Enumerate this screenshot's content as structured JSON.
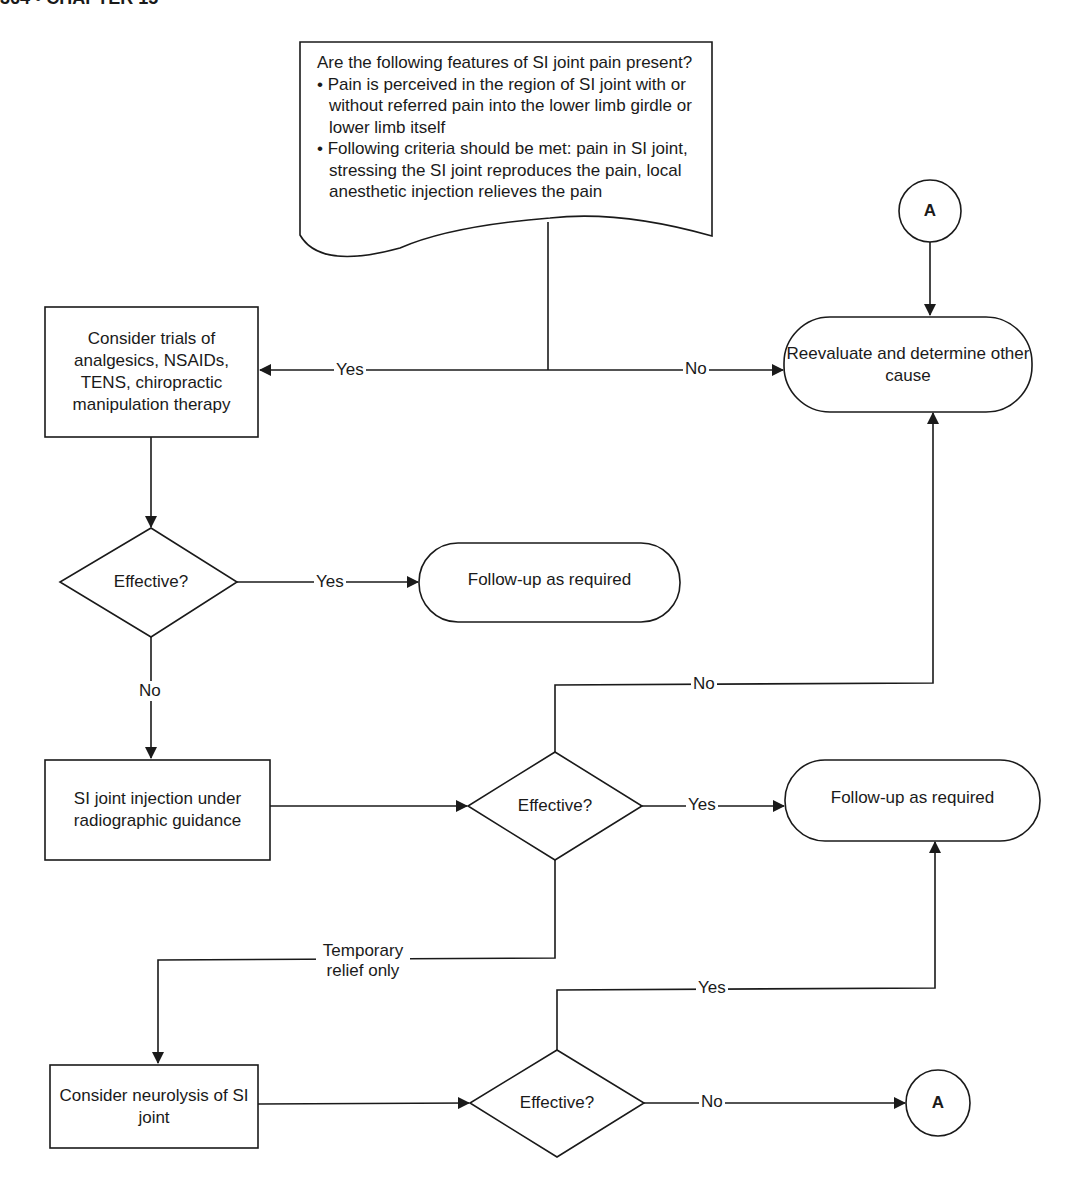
{
  "page_header": {
    "text": "364 • CHAPTER 15"
  },
  "diagram": {
    "start": {
      "question": "Are the following features of SI joint pain present?",
      "bullets": [
        "• Pain is perceived in the region of SI joint with or without referred pain into the lower limb girdle or lower limb itself",
        "• Following criteria should be met: pain in SI joint, stressing the SI joint reproduces the pain, local anesthetic injection relieves the pain"
      ]
    },
    "nodes": {
      "trial_box": "Consider trials of analgesics, NSAIDs, TENS, chiropractic manipulation therapy",
      "effective_1": "Effective?",
      "followup_1": "Follow-up as required",
      "reevaluate": "Reevaluate and determine other cause",
      "injection_box": "SI joint injection under radiographic guidance",
      "effective_2": "Effective?",
      "followup_2": "Follow-up as required",
      "neurolysis_box": "Consider neurolysis of SI joint",
      "effective_3": "Effective?",
      "connector_top": "A",
      "connector_bottom": "A"
    },
    "edge_labels": {
      "start_yes": "Yes",
      "start_no": "No",
      "eff1_yes": "Yes",
      "eff1_no": "No",
      "eff2_no": "No",
      "eff2_yes": "Yes",
      "eff2_temp": "Temporary relief only",
      "eff3_yes": "Yes",
      "eff3_no": "No"
    },
    "colors": {
      "stroke": "#1a1a1a",
      "background": "#ffffff"
    }
  }
}
